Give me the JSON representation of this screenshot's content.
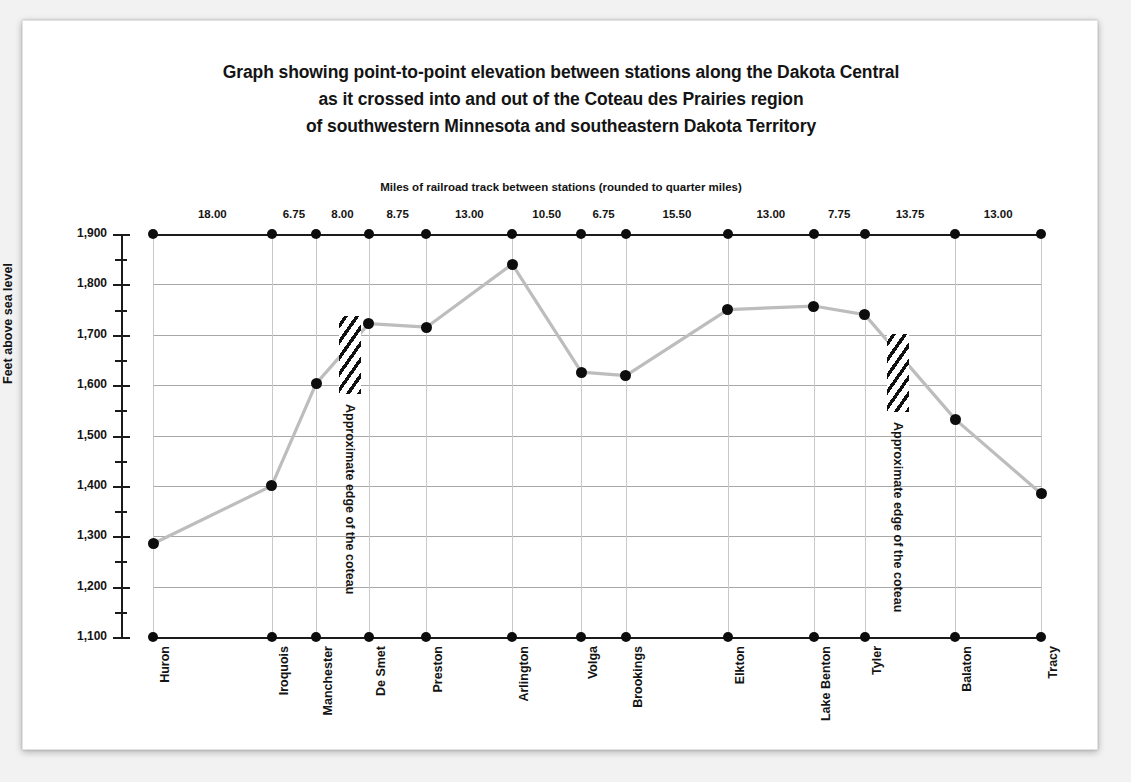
{
  "title": {
    "line1": "Graph showing point-to-point elevation between stations along the Dakota Central",
    "line2": "as it crossed into and out of the Coteau des Prairies region",
    "line3": "of southwestern Minnesota and southeastern Dakota Territory"
  },
  "top_axis_caption": "Miles of railroad track between stations (rounded to quarter miles)",
  "y_axis_title": "Feet above sea level",
  "annotations": {
    "coteau_west": "Approximate edge of the coteau",
    "coteau_east": "Approximate edge of the coteau"
  },
  "colors": {
    "background": "#f2f2f2",
    "card": "#ffffff",
    "axis": "#1b1b1b",
    "grid": "#b9b9b9",
    "marker": "#0d0d0d",
    "line": "#bdbdbd",
    "text": "#141414"
  },
  "chart_data": {
    "type": "line",
    "xlabel": "Miles of railroad track between stations (rounded to quarter miles)",
    "ylabel": "Feet above sea level",
    "ylim": [
      1100,
      1900
    ],
    "yticks": [
      1100,
      1200,
      1300,
      1400,
      1500,
      1600,
      1700,
      1800,
      1900
    ],
    "ytick_labels": [
      "1,100",
      "1,200",
      "1,300",
      "1,400",
      "1,500",
      "1,600",
      "1,700",
      "1,800",
      "1,900"
    ],
    "yticks_minor": [
      1150,
      1250,
      1350,
      1450,
      1550,
      1650,
      1750,
      1850
    ],
    "grid": true,
    "legend": "none",
    "categories": [
      "Huron",
      "Iroquois",
      "Manchester",
      "De Smet",
      "Preston",
      "Arlington",
      "Volga",
      "Brookings",
      "Elkton",
      "Lake Benton",
      "Tyler",
      "Balaton",
      "Tracy"
    ],
    "values": [
      1285,
      1400,
      1603,
      1722,
      1715,
      1840,
      1626,
      1619,
      1750,
      1757,
      1740,
      1532,
      1385
    ],
    "x_positions_miles": [
      0,
      18.0,
      24.75,
      32.75,
      41.5,
      54.5,
      65.0,
      71.75,
      87.25,
      100.25,
      108.0,
      121.75,
      134.75
    ],
    "segment_miles": [
      18.0,
      6.75,
      8.0,
      8.75,
      13.0,
      10.5,
      6.75,
      15.5,
      13.0,
      7.75,
      13.75,
      13.0
    ],
    "segment_labels": [
      "18.00",
      "6.75",
      "8.00",
      "8.75",
      "13.00",
      "10.50",
      "6.75",
      "15.50",
      "13.00",
      "7.75",
      "13.75",
      "13.00"
    ],
    "coteau_markers": [
      {
        "label": "Approximate edge of the coteau",
        "between": "Manchester - De Smet"
      },
      {
        "label": "Approximate edge of the coteau",
        "between": "Tyler - Balaton"
      }
    ]
  }
}
